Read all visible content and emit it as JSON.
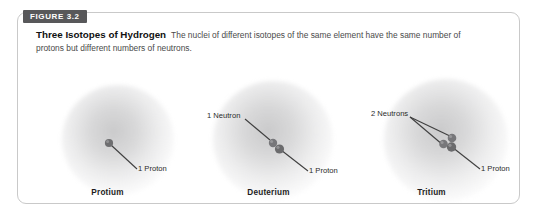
{
  "figure": {
    "tab_label": "FIGURE 3.2",
    "title": "Three Isotopes of Hydrogen",
    "caption": "The nuclei of different isotopes of the same element have the same number of protons but different numbers of neutrons."
  },
  "colors": {
    "tab_background": "#58585a",
    "tab_text": "#ffffff",
    "panel_border": "#c9c9c9",
    "page_background": "#ffffff",
    "cloud_gray": "#9a9a9c",
    "nucleon_gray": "#6e6e70",
    "leader_line": "#3f3f3f",
    "title_text": "#111111",
    "caption_text": "#4a4a4a"
  },
  "isotopes": [
    {
      "name": "Protium",
      "protons": 1,
      "neutrons": 0,
      "labels": [
        {
          "text": "1 Proton",
          "kind": "proton"
        }
      ]
    },
    {
      "name": "Deuterium",
      "protons": 1,
      "neutrons": 1,
      "labels": [
        {
          "text": "1 Neutron",
          "kind": "neutron"
        },
        {
          "text": "1 Proton",
          "kind": "proton"
        }
      ]
    },
    {
      "name": "Tritium",
      "protons": 1,
      "neutrons": 2,
      "labels": [
        {
          "text": "2 Neutrons",
          "kind": "neutron"
        },
        {
          "text": "1 Proton",
          "kind": "proton"
        }
      ]
    }
  ]
}
